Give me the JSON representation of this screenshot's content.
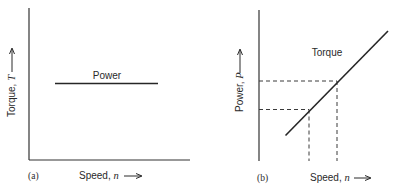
{
  "figure": {
    "panels": [
      {
        "id": "a",
        "tag": "(a)",
        "x_axis_label": "Speed, ",
        "x_axis_symbol": "n",
        "y_axis_label": "Torque, ",
        "y_axis_symbol": "T",
        "curve_label": "Power",
        "curve_type": "horizontal-line"
      },
      {
        "id": "b",
        "tag": "(b)",
        "x_axis_label": "Speed, ",
        "x_axis_symbol": "n",
        "y_axis_label": "Power, ",
        "y_axis_symbol": "P",
        "curve_label": "Torque",
        "curve_type": "rising-line",
        "guides": "two dashed projections from line to both axes"
      }
    ],
    "colors": {
      "ink": "#2a2a2a",
      "axis": "#333333",
      "tint_blue": "#4a7fd0",
      "tint_red": "#d8847a",
      "tint_cyan": "#5fb8d8"
    }
  }
}
